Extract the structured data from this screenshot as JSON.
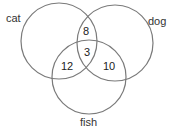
{
  "diagram": {
    "type": "venn",
    "sets": [
      {
        "id": "cat",
        "label": "cat"
      },
      {
        "id": "dog",
        "label": "dog"
      },
      {
        "id": "fish",
        "label": "fish"
      }
    ],
    "regions": {
      "cat_dog": "8",
      "cat_dog_fish": "3",
      "cat_fish": "12",
      "dog_fish": "10"
    },
    "stroke_color": "#7a7a7a",
    "text_color": "#333333"
  }
}
